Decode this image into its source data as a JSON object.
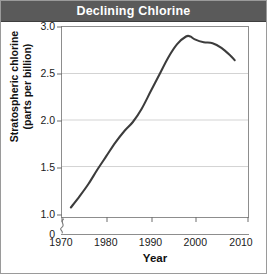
{
  "header": {
    "title": "Declining Chlorine"
  },
  "axes": {
    "ylabel_line1": "Stratospheric chlorine",
    "ylabel_line2": "(parts per billion)",
    "xlabel": "Year",
    "yticks": [
      "3.0",
      "2.5",
      "2.0",
      "1.5",
      "1.0",
      "0"
    ],
    "xticks": [
      "1970",
      "1980",
      "1990",
      "2000",
      "2010"
    ]
  },
  "caption": {
    "text": ""
  },
  "colors": {
    "header_bg": "#5a5a5a",
    "header_text": "#ffffff",
    "curve": "#3c3c3c",
    "grid": "#d2d2d2",
    "frame": "#8d8d8d",
    "page_bg": "#ffffff"
  },
  "chart_data": {
    "type": "line",
    "title": "Declining Chlorine",
    "xlabel": "Year",
    "ylabel": "Stratospheric chlorine (parts per billion)",
    "xlim": [
      1968,
      2010
    ],
    "ylim": [
      1.0,
      3.0
    ],
    "y_axis_break": true,
    "y_axis_break_note": "axis broken between 0 and 1.0",
    "ytick_values": [
      0,
      1.0,
      1.5,
      2.0,
      2.5,
      3.0
    ],
    "xtick_values": [
      1970,
      1980,
      1990,
      2000,
      2010
    ],
    "grid": "horizontal",
    "legend": "none",
    "series": [
      {
        "name": "Stratospheric chlorine",
        "x": [
          1970,
          1972,
          1974,
          1976,
          1978,
          1980,
          1982,
          1984,
          1986,
          1988,
          1990,
          1992,
          1994,
          1996,
          1997,
          1998,
          2000,
          2002,
          2004,
          2006,
          2007
        ],
        "values": [
          1.1,
          1.22,
          1.35,
          1.5,
          1.64,
          1.78,
          1.9,
          2.0,
          2.14,
          2.32,
          2.5,
          2.68,
          2.82,
          2.9,
          2.9,
          2.87,
          2.84,
          2.83,
          2.78,
          2.7,
          2.65
        ]
      }
    ]
  }
}
